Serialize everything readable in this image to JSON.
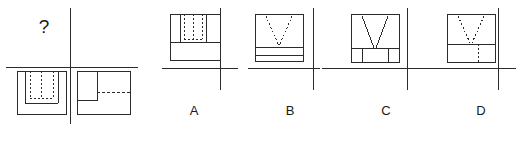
{
  "figure": {
    "type": "orthographic-projection-puzzle",
    "question_mark": "?",
    "line_color": "#2b2b2b",
    "dash_color": "#2b2b2b",
    "background": "#ffffff"
  },
  "prompt_panel": {
    "name": "given-views-quadrant",
    "missing_view_marker": "?",
    "missing_view_quadrant": "top-left",
    "views": [
      {
        "position": "bottom-left",
        "name": "front-view",
        "outline": "rectangle",
        "features": "two solid vertical slot walls with hidden dashed rectangle between them, notch open at bottom"
      },
      {
        "position": "bottom-right",
        "name": "side-view",
        "outline": "rectangle",
        "features": "solid inner rectangle at left, horizontal hidden dashed line extending right"
      }
    ]
  },
  "options": [
    {
      "id": "A",
      "label": "A",
      "name": "option-a",
      "outline": "rectangle",
      "features": "wide rectangle, upper band split by two solid vertical lines with hidden dashed rectangle between them, horizontal solid line below band"
    },
    {
      "id": "B",
      "label": "B",
      "name": "option-b",
      "outline": "rectangle",
      "features": "upper square with hidden dashed V, two horizontal solid lines forming a band at the bottom"
    },
    {
      "id": "C",
      "label": "C",
      "name": "option-c",
      "outline": "rectangle",
      "features": "square with solid V in upper area and two small solid rectangles at lower left and lower right corners"
    },
    {
      "id": "D",
      "label": "D",
      "name": "option-d",
      "outline": "rectangle",
      "features": "upper area with hidden dashed V, horizontal solid divider, lower band with short vertical dashed line"
    }
  ]
}
